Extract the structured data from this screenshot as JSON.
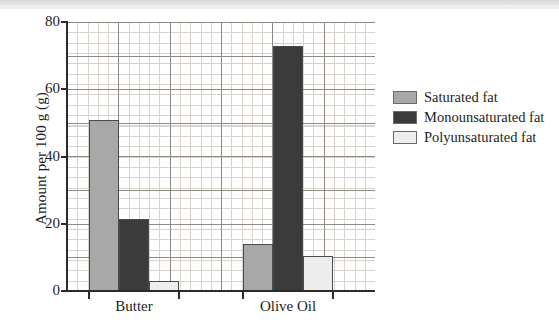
{
  "chart_data": {
    "type": "bar",
    "title": "",
    "xlabel": "",
    "ylabel": "Amount per 100 g (g)",
    "categories": [
      "Butter",
      "Olive Oil"
    ],
    "series": [
      {
        "name": "Saturated fat",
        "values": [
          51,
          14
        ],
        "color": "#a8a8a8"
      },
      {
        "name": "Monounsaturated fat",
        "values": [
          21.5,
          73
        ],
        "color": "#3b3b3b"
      },
      {
        "name": "Polyunsaturated fat",
        "values": [
          3,
          10.5
        ],
        "color": "#ededed"
      }
    ],
    "ylim": [
      0,
      80
    ],
    "yticks": [
      0,
      20,
      40,
      60,
      80
    ],
    "ytick_labels": [
      "0",
      "20",
      "40",
      "60",
      "80"
    ],
    "grid": true,
    "grid_minor": true,
    "legend_position": "right"
  },
  "legend": {
    "items": [
      {
        "label": "Saturated fat",
        "color": "#a8a8a8"
      },
      {
        "label": "Monounsaturated fat",
        "color": "#3b3b3b"
      },
      {
        "label": "Polyunsaturated fat",
        "color": "#ededed"
      }
    ]
  }
}
